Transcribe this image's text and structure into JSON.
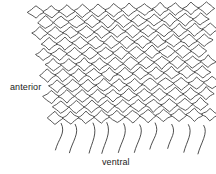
{
  "figure": {
    "type": "line-drawing",
    "background_color": "#ffffff",
    "line_color": "#3a3a3a",
    "cell_fill": "#ffffff"
  },
  "labels": {
    "anterior": "anterior",
    "ventral": "ventral"
  },
  "chart_data": {
    "type": "diagram",
    "title": "",
    "mesh": {
      "rows": 11,
      "cols": 12,
      "cell_width": 15.5,
      "cell_height": 10.6,
      "origin_x": 36,
      "origin_y": 12,
      "row_shear_x": 1.9,
      "left_edge_slope": 1.0,
      "top_edge_rise": -0.35
    },
    "trailing_lines": {
      "count": 10,
      "start_y": 124,
      "end_y": 152,
      "curve_bow": 5.5
    },
    "annotations": [
      {
        "text": "anterior",
        "x": 10,
        "y": 87,
        "anchor": "left"
      },
      {
        "text": "ventral",
        "x": 120,
        "y": 163,
        "anchor": "middle"
      }
    ]
  }
}
